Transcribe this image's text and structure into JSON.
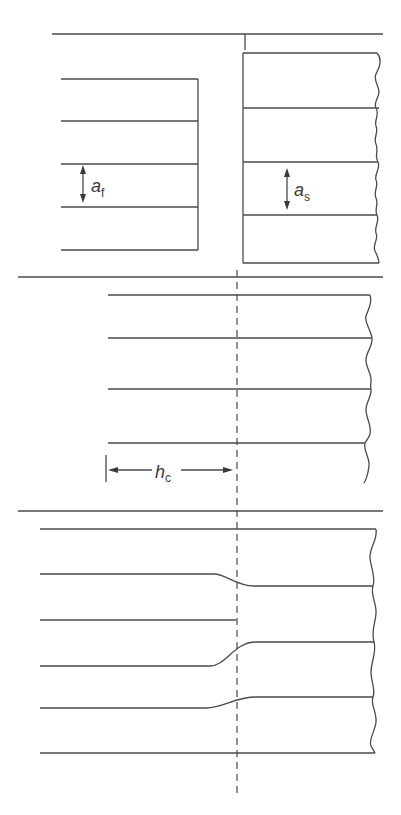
{
  "diagram": {
    "colors": {
      "line": "#4a4a4a",
      "background": "#ffffff",
      "text": "#3a3a3a"
    },
    "panels": [
      {
        "id": "top",
        "labels": {
          "a_f": {
            "main": "a",
            "sub": "f"
          },
          "a_s": {
            "main": "a",
            "sub": "s"
          }
        }
      },
      {
        "id": "middle",
        "labels": {
          "h_c": {
            "main": "h",
            "sub": "c"
          }
        }
      },
      {
        "id": "bottom",
        "labels": {}
      }
    ]
  }
}
